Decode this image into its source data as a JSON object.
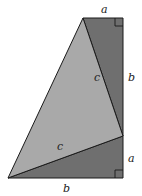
{
  "diagram": {
    "title": "",
    "colors": {
      "dark_triangle": "#6f6f6f",
      "light_triangle": "#a9a9a9",
      "stroke": "#1a1a1a",
      "background": "#ffffff"
    },
    "vertices": {
      "top_left": [
        83,
        18
      ],
      "top_right": [
        123,
        18
      ],
      "right_mid": [
        123,
        136
      ],
      "bottom_right": [
        123,
        178
      ],
      "bottom_left": [
        8,
        178
      ]
    },
    "shapes": [
      {
        "name": "upper-right-triangle",
        "points": "83,18 123,18 123,136",
        "fill": "dark",
        "legs": [
          "a",
          "b"
        ],
        "hypotenuse": "c"
      },
      {
        "name": "lower-right-triangle",
        "points": "8,178 123,178 123,136",
        "fill": "dark",
        "legs": [
          "b",
          "a"
        ],
        "hypotenuse": "c"
      },
      {
        "name": "middle-isosceles-triangle",
        "points": "83,18 123,136 8,178",
        "fill": "light",
        "legs": [
          "c",
          "c"
        ]
      }
    ],
    "labels": {
      "top_a": "a",
      "right_b": "b",
      "right_a": "a",
      "bottom_b": "b",
      "upper_c": "c",
      "lower_c": "c"
    },
    "right_angle_markers": [
      {
        "corner": "top_right"
      },
      {
        "corner": "bottom_right"
      }
    ]
  }
}
